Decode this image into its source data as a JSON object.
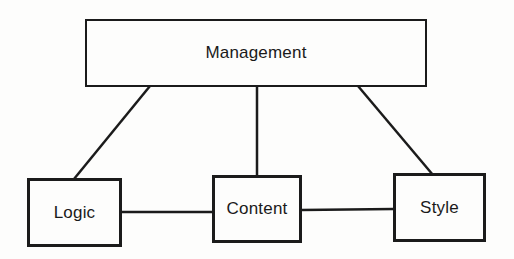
{
  "diagram": {
    "background_color": "#fdfdfc",
    "line_color": "#1b1b1b",
    "nodes": {
      "management": {
        "label": "Management"
      },
      "logic": {
        "label": "Logic"
      },
      "content": {
        "label": "Content"
      },
      "style": {
        "label": "Style"
      }
    },
    "edges": [
      {
        "from": "management",
        "to": "logic",
        "shape": "diagonal"
      },
      {
        "from": "management",
        "to": "content",
        "shape": "vertical"
      },
      {
        "from": "management",
        "to": "style",
        "shape": "diagonal"
      },
      {
        "from": "logic",
        "to": "content",
        "shape": "horizontal"
      },
      {
        "from": "content",
        "to": "style",
        "shape": "horizontal"
      }
    ]
  }
}
